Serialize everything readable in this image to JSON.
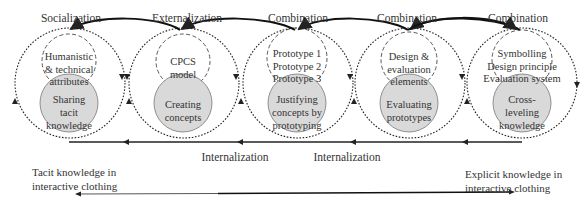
{
  "diagram": {
    "type": "knowledge-spiral",
    "phases_top": [
      "Socialization",
      "Externalization",
      "Combination",
      "Combination",
      "Combination"
    ],
    "stages": [
      {
        "inner_lines": [
          "Humanistic",
          "& technical",
          "attributes"
        ],
        "core_lines": [
          "Sharing",
          "tacit",
          "knowledge"
        ]
      },
      {
        "inner_lines": [
          "CPCS",
          "model"
        ],
        "core_lines": [
          "Creating",
          "concepts"
        ]
      },
      {
        "inner_lines": [
          "Prototype 1",
          "Prototype 2",
          "Prototype 3"
        ],
        "core_lines": [
          "Justifying",
          "concepts by",
          "prototyping"
        ]
      },
      {
        "inner_lines": [
          "Design &",
          "evaluation",
          "elements"
        ],
        "core_lines": [
          "Evaluating",
          "prototypes"
        ]
      },
      {
        "inner_lines": [
          "Symbolling",
          "Design principle",
          "Evaluation system"
        ],
        "core_lines": [
          "Cross-",
          "leveling",
          "knowledge"
        ]
      }
    ],
    "phases_bottom": [
      "Internalization",
      "Internalization"
    ],
    "axis": {
      "left_label_lines": [
        "Tacit knowledge in",
        "interactive clothing"
      ],
      "right_label_lines": [
        "Explicit  knowledge in",
        "interactive clothing"
      ]
    },
    "colors": {
      "stroke": "#222222",
      "core_fill": "#d9d9d9",
      "text": "#333333"
    }
  }
}
